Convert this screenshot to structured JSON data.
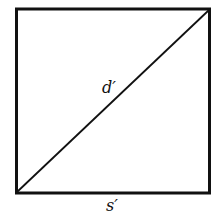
{
  "diagram": {
    "type": "square-with-diagonal",
    "labels": {
      "diagonal": "d′",
      "side": "s′"
    },
    "colors": {
      "stroke": "#111111",
      "background": "#ffffff"
    }
  }
}
